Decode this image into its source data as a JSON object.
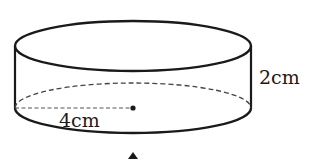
{
  "figure": {
    "shape": "cylinder",
    "stroke_color": "#1a1a1a",
    "dash_color": "#444444",
    "labels": {
      "height": "2cm",
      "radius": "4cm"
    },
    "geometry": {
      "center_x": 133,
      "top_center_y": 46,
      "bottom_center_y": 108,
      "rx": 118,
      "ry": 25
    },
    "center_point": "dot",
    "partial_marker": "triangle-up"
  }
}
